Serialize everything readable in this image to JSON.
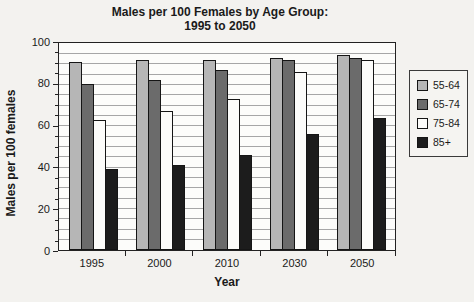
{
  "title": {
    "line1": "Males per 100 Females by Age Group:",
    "line2": "1995 to 2050"
  },
  "chart_data": {
    "type": "bar",
    "title": "Males per 100 Females by Age Group: 1995 to 2050",
    "categories": [
      "1995",
      "2000",
      "2010",
      "2030",
      "2050"
    ],
    "series": [
      {
        "name": "55-64",
        "color": "#b6b6b6",
        "values": [
          91,
          92,
          92,
          93,
          94
        ]
      },
      {
        "name": "65-74",
        "color": "#6b6b6b",
        "values": [
          80,
          82,
          87,
          92,
          93
        ]
      },
      {
        "name": "75-84",
        "color": "#fcfcfa",
        "values": [
          63,
          67,
          73,
          86,
          92
        ]
      },
      {
        "name": "85+",
        "color": "#1c1c1c",
        "values": [
          39,
          41,
          46,
          56,
          64
        ]
      }
    ],
    "xlabel": "Year",
    "ylabel": "Males per 100 females",
    "ylim": [
      0,
      100
    ],
    "yticks": [
      0,
      20,
      40,
      60,
      80,
      100
    ],
    "minor_grid_step": 5,
    "grid": true,
    "legend_position": "right",
    "bar_border_color": "#151515",
    "gridline_color": "#a6a6a6",
    "plot_background": "#fcfcfa",
    "page_background": "#f3f2ef"
  }
}
